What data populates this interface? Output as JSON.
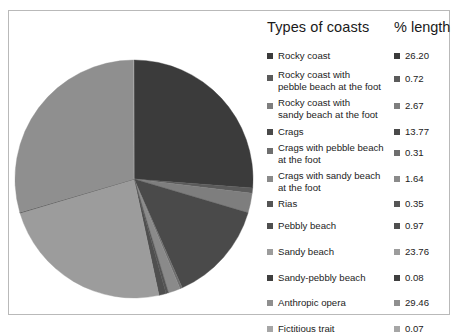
{
  "legend": {
    "header": {
      "types_label": "Types of coasts",
      "percent_label": "% length"
    }
  },
  "chart_data": {
    "type": "pie",
    "title": "",
    "subtitle": "",
    "xlabel": "",
    "ylabel": "",
    "legend_position": "right",
    "grid": false,
    "value_unit": "%",
    "value_header": "% length",
    "category_header": "Types of coasts",
    "start_angle_deg": 0,
    "direction": "clockwise",
    "categories": [
      "Rocky coast",
      "Rocky coast with\npebble beach at the foot",
      "Rocky coast with\nsandy beach at the foot",
      "Crags",
      "Crags with pebble beach\nat the foot",
      "Crags with sandy beach\nat the foot",
      "Rias",
      "Pebbly beach",
      "Sandy beach",
      "Sandy-pebbly beach",
      "Anthropic opera",
      "Fictitious trait"
    ],
    "values": [
      26.2,
      0.72,
      2.67,
      13.77,
      0.31,
      1.64,
      0.35,
      0.97,
      23.76,
      0.08,
      29.46,
      0.07
    ],
    "value_labels": [
      "26.20",
      "0.72",
      "2.67",
      "13.77",
      "0.31",
      "1.64",
      "0.35",
      "0.97",
      "23.76",
      "0.08",
      "29.46",
      "0.07"
    ],
    "colors": [
      "#3b3b3b",
      "#5b5b5b",
      "#7e7e7e",
      "#4a4a4a",
      "#6e6e6e",
      "#8a8a8a",
      "#555555",
      "#4f4f4f",
      "#9c9c9c",
      "#3f3f3f",
      "#8f8f8f",
      "#a6a6a6"
    ]
  }
}
